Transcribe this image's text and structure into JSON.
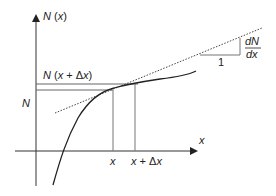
{
  "diagram": {
    "y_axis_label": "N (x)",
    "x_axis_label": "x",
    "upper_level_label": "N (x + Δx)",
    "lower_level_label": "N",
    "x_tick_label": "x",
    "x_plus_dx_tick_label": "x + Δx",
    "slope_numerator": "dN",
    "slope_denominator": "dx",
    "slope_run_label": "1",
    "colors": {
      "axis": "#333333",
      "curve": "#222222",
      "guide_lines": "#777777",
      "tangent": "#444444"
    }
  }
}
